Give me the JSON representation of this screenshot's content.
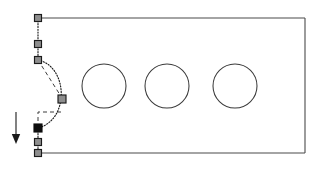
{
  "canvas": {
    "width": 318,
    "height": 172,
    "background_color": "#ffffff",
    "title": "Sketch Editor Canvas",
    "mode_label": "edit-node"
  },
  "colors": {
    "outline_stroke": "#4a4a4a",
    "hole_stroke": "#3a3a3a",
    "selected_path_stroke": "#1c1c1c",
    "tangent_stroke": "#3d3d3d",
    "node_fill": "#8e8e8e",
    "node_border": "#1b1b1b",
    "node_selected_fill": "#0d0d0d",
    "arrow_color": "#1a1a1a"
  },
  "part_outline": {
    "name": "rectangular-plate-profile",
    "shape": "rectangle",
    "x": 38,
    "y": 18,
    "width": 267,
    "height": 135,
    "stroke_width": 1.1,
    "top_edge": "M 38 18 L 305 18",
    "right_edge": "M 305 18 L 305 153",
    "bottom_edge": "M 305 153 L 38 153"
  },
  "holes": [
    {
      "name": "hole-1",
      "cx": 104,
      "cy": 86,
      "r": 22
    },
    {
      "name": "hole-2",
      "cx": 167,
      "cy": 86,
      "r": 22
    },
    {
      "name": "hole-3",
      "cx": 235,
      "cy": 86,
      "r": 22
    }
  ],
  "selected_path": {
    "name": "left-edge-bezier",
    "style": "dotted",
    "segments": [
      {
        "name": "straight-upper",
        "d": "M 38 18 L 38 44 L 38 60"
      },
      {
        "name": "bezier-bulge",
        "d": "M 38 60 C 68 66 70 120 38 128"
      }
    ]
  },
  "tangent_lines": [
    {
      "name": "tangent-upper",
      "d": "M 38 60 L 62 98"
    },
    {
      "name": "tangent-lower",
      "d": "M 38 128 L 38 112 L 62 112"
    }
  ],
  "nodes": [
    {
      "name": "node-top-corner",
      "x": 38,
      "y": 18,
      "size": 7,
      "selected": false,
      "label": "anchor"
    },
    {
      "name": "node-upper-mid",
      "x": 38,
      "y": 44,
      "size": 7,
      "selected": false,
      "label": "anchor"
    },
    {
      "name": "node-curve-start",
      "x": 38,
      "y": 60,
      "size": 7,
      "selected": false,
      "label": "anchor"
    },
    {
      "name": "node-control-bulge",
      "x": 62,
      "y": 99,
      "size": 8,
      "selected": false,
      "label": "control"
    },
    {
      "name": "node-curve-end",
      "x": 38,
      "y": 128,
      "size": 8,
      "selected": true,
      "label": "anchor-selected"
    },
    {
      "name": "node-lower-mid",
      "x": 38,
      "y": 142,
      "size": 7,
      "selected": false,
      "label": "anchor"
    },
    {
      "name": "node-bottom-corner",
      "x": 38,
      "y": 153,
      "size": 7,
      "selected": false,
      "label": "anchor"
    }
  ],
  "direction_arrow": {
    "name": "downward-direction-arrow",
    "x": 16,
    "y_start": 112,
    "y_end": 137,
    "head_points": "11.8,134 20.2,134 16,144",
    "direction": "down"
  }
}
